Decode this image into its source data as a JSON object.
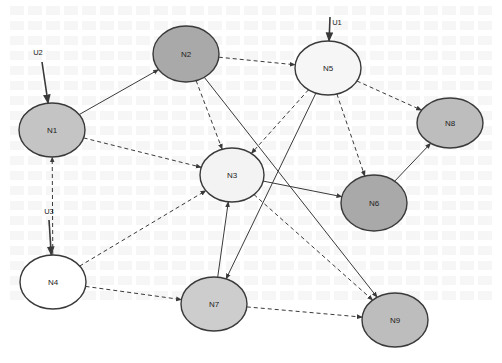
{
  "diagram": {
    "type": "directed-graph",
    "colors": {
      "stroke": "#3a3a3a",
      "fill_dark": "#a9a9a9",
      "fill_mid": "#bfbfbf",
      "fill_light": "#cdcdcd",
      "fill_pale": "#f3f3f3",
      "fill_white": "#ffffff"
    },
    "inputs": [
      {
        "id": "U1",
        "label": "U1",
        "target": "N5"
      },
      {
        "id": "U2",
        "label": "U2",
        "target": "N1"
      },
      {
        "id": "U3",
        "label": "U3",
        "target": "N4"
      }
    ],
    "nodes": [
      {
        "id": "N1",
        "label": "N1",
        "cx": 52,
        "cy": 130,
        "rx": 33,
        "ry": 27,
        "fill": "#c4c4c4"
      },
      {
        "id": "N2",
        "label": "N2",
        "cx": 186,
        "cy": 54,
        "rx": 33,
        "ry": 28,
        "fill": "#a9a9a9"
      },
      {
        "id": "N3",
        "label": "N3",
        "cx": 232,
        "cy": 175,
        "rx": 32,
        "ry": 27,
        "fill": "#f3f3f3"
      },
      {
        "id": "N4",
        "label": "N4",
        "cx": 53,
        "cy": 282,
        "rx": 33,
        "ry": 27,
        "fill": "#ffffff"
      },
      {
        "id": "N5",
        "label": "N5",
        "cx": 328,
        "cy": 68,
        "rx": 33,
        "ry": 27,
        "fill": "#f6f6f6"
      },
      {
        "id": "N6",
        "label": "N6",
        "cx": 374,
        "cy": 203,
        "rx": 33,
        "ry": 28,
        "fill": "#a9a9a9"
      },
      {
        "id": "N7",
        "label": "N7",
        "cx": 214,
        "cy": 304,
        "rx": 33,
        "ry": 27,
        "fill": "#cdcdcd"
      },
      {
        "id": "N8",
        "label": "N8",
        "cx": 450,
        "cy": 123,
        "rx": 33,
        "ry": 25,
        "fill": "#bdbdbd"
      },
      {
        "id": "N9",
        "label": "N9",
        "cx": 395,
        "cy": 320,
        "rx": 33,
        "ry": 27,
        "fill": "#bdbdbd"
      }
    ],
    "edges": [
      {
        "from": "U2",
        "to": "N1",
        "style": "solid"
      },
      {
        "from": "U1",
        "to": "N5",
        "style": "solid"
      },
      {
        "from": "U3",
        "to": "N4",
        "style": "solid"
      },
      {
        "from": "N1",
        "to": "N2",
        "style": "solid"
      },
      {
        "from": "N1",
        "to": "N3",
        "style": "dashed"
      },
      {
        "from": "N4",
        "to": "N1",
        "style": "dashed"
      },
      {
        "from": "N2",
        "to": "N5",
        "style": "dashed"
      },
      {
        "from": "N2",
        "to": "N3",
        "style": "dashed"
      },
      {
        "from": "N2",
        "to": "N9",
        "style": "solid"
      },
      {
        "from": "N5",
        "to": "N3",
        "style": "dashed"
      },
      {
        "from": "N5",
        "to": "N6",
        "style": "dashed"
      },
      {
        "from": "N5",
        "to": "N8",
        "style": "dashed"
      },
      {
        "from": "N5",
        "to": "N7",
        "style": "solid"
      },
      {
        "from": "N3",
        "to": "N6",
        "style": "solid"
      },
      {
        "from": "N3",
        "to": "N9",
        "style": "dashed"
      },
      {
        "from": "N6",
        "to": "N8",
        "style": "solid"
      },
      {
        "from": "N7",
        "to": "N3",
        "style": "solid"
      },
      {
        "from": "N4",
        "to": "N3",
        "style": "dashed"
      },
      {
        "from": "N4",
        "to": "N7",
        "style": "dashed"
      },
      {
        "from": "N7",
        "to": "N9",
        "style": "dashed"
      }
    ]
  }
}
